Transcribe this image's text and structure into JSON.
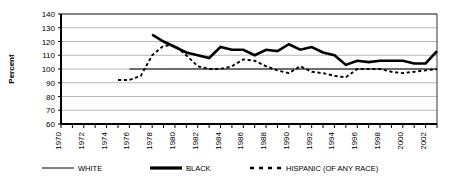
{
  "chart_data": {
    "type": "line",
    "title": "",
    "xlabel": "",
    "ylabel": "Percent",
    "ylim": [
      60,
      140
    ],
    "xlim": [
      1970,
      2003
    ],
    "ytick_labels": [
      "140",
      "130",
      "120",
      "110",
      "100",
      "90",
      "80",
      "70",
      "60"
    ],
    "ytick_values": [
      140,
      130,
      120,
      110,
      100,
      90,
      80,
      70,
      60
    ],
    "xtick_labels": [
      "1970",
      "1972",
      "1974",
      "1976",
      "1978",
      "1980",
      "1982",
      "1984",
      "1986",
      "1988",
      "1990",
      "1992",
      "1994",
      "1996",
      "1998",
      "2000",
      "2002"
    ],
    "xtick_values": [
      1970,
      1972,
      1974,
      1976,
      1978,
      1980,
      1982,
      1984,
      1986,
      1988,
      1990,
      1992,
      1994,
      1996,
      1998,
      2000,
      2002
    ],
    "grid": true,
    "grid_axis": "y",
    "legend_position": "bottom",
    "series": [
      {
        "name": "WHITE",
        "style": "solid-thin",
        "color": "#000000",
        "x": [
          1976,
          1977,
          1978,
          1979,
          1980,
          1981,
          1982,
          1983,
          1984,
          1985,
          1986,
          1987,
          1988,
          1989,
          1990,
          1991,
          1992,
          1993,
          1994,
          1995,
          1996,
          1997,
          1998,
          1999,
          2000,
          2001,
          2002,
          2003
        ],
        "values": [
          100,
          100,
          100,
          100,
          100,
          100,
          100,
          100,
          100,
          100,
          100,
          100,
          100,
          100,
          100,
          100,
          100,
          100,
          100,
          100,
          100,
          100,
          100,
          100,
          100,
          100,
          100,
          100
        ]
      },
      {
        "name": "BLACK",
        "style": "solid-thick",
        "color": "#000000",
        "x": [
          1978,
          1979,
          1980,
          1981,
          1982,
          1983,
          1984,
          1985,
          1986,
          1987,
          1988,
          1989,
          1990,
          1991,
          1992,
          1993,
          1994,
          1995,
          1996,
          1997,
          1998,
          1999,
          2000,
          2001,
          2002,
          2003
        ],
        "values": [
          125,
          120,
          116,
          112,
          110,
          108,
          116,
          114,
          114,
          110,
          114,
          113,
          118,
          114,
          116,
          112,
          110,
          103,
          106,
          105,
          106,
          106,
          106,
          104,
          104,
          113
        ]
      },
      {
        "name": "HISPANIC (OF ANY RACE)",
        "style": "dashed",
        "color": "#000000",
        "x": [
          1975,
          1976,
          1977,
          1978,
          1979,
          1980,
          1981,
          1982,
          1983,
          1984,
          1985,
          1986,
          1987,
          1988,
          1989,
          1990,
          1991,
          1992,
          1993,
          1994,
          1995,
          1996,
          1997,
          1998,
          1999,
          2000,
          2001,
          2002,
          2003
        ],
        "values": [
          92,
          92,
          95,
          110,
          117,
          117,
          110,
          102,
          100,
          100,
          102,
          107,
          106,
          102,
          99,
          97,
          102,
          98,
          97,
          95,
          94,
          100,
          100,
          100,
          98,
          97,
          98,
          99,
          100
        ]
      }
    ],
    "legend": [
      {
        "label": "WHITE",
        "style": "solid-thin"
      },
      {
        "label": "BLACK",
        "style": "solid-thick"
      },
      {
        "label": "HISPANIC (OF ANY RACE)",
        "style": "dashed"
      }
    ]
  }
}
